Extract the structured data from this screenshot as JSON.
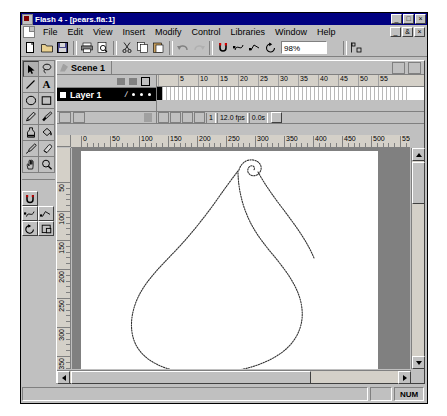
{
  "window": {
    "title": "Flash 4 - [pears.fla:1]",
    "app_icon": "flash-icon",
    "minimize": "_",
    "maximize": "□",
    "close": "×"
  },
  "menubar": {
    "doc_icon": "document-icon",
    "items": [
      {
        "label": "File",
        "accel": "F"
      },
      {
        "label": "Edit",
        "accel": "E"
      },
      {
        "label": "View",
        "accel": "V"
      },
      {
        "label": "Insert",
        "accel": "I"
      },
      {
        "label": "Modify",
        "accel": "o"
      },
      {
        "label": "Control",
        "accel": "C"
      },
      {
        "label": "Libraries",
        "accel": "L"
      },
      {
        "label": "Window",
        "accel": "W"
      },
      {
        "label": "Help",
        "accel": "H"
      }
    ],
    "mdi_minimize": "_",
    "mdi_restore": "&",
    "mdi_close": "×"
  },
  "toolbar": {
    "buttons": [
      "new-icon",
      "open-icon",
      "save-icon",
      "print-icon",
      "print-preview-icon",
      "cut-icon",
      "copy-icon",
      "paste-icon",
      "undo-icon",
      "redo-icon",
      "snap-icon",
      "smooth-icon",
      "straighten-icon",
      "rotate-icon"
    ],
    "zoom_value": "98%",
    "zoom_dropdown_icon": "chevron-down-icon",
    "align_icon": "align-icon"
  },
  "scenebar": {
    "scene_icon": "scene-icon",
    "scene_name": "Scene 1",
    "edit_scene_icon": "edit-scene-icon",
    "edit_symbol_icon": "edit-symbol-icon"
  },
  "timeline": {
    "layer_header_icons": [
      "eye-icon",
      "lock-icon",
      "outline-icon"
    ],
    "layers": [
      {
        "name": "Layer 1",
        "selected": true,
        "pencil_icon": "pencil-icon"
      }
    ],
    "add_layer_icon": "add-layer-icon",
    "add_guide_icon": "add-guide-icon",
    "delete_layer_icon": "trash-icon",
    "ruler_ticks": [
      "5",
      "10",
      "15",
      "20",
      "25",
      "30",
      "35",
      "40",
      "45",
      "50",
      "55"
    ],
    "current_frame": "1",
    "frame_rate": "12.0 fps",
    "elapsed_time": "0.0s",
    "onion_buttons": [
      "onion-skin-icon",
      "onion-outline-icon",
      "edit-multiple-icon",
      "modify-onion-icon"
    ],
    "center_frame_icon": "center-frame-icon"
  },
  "stage": {
    "hruler_ticks": [
      "0",
      "50",
      "100",
      "150",
      "200",
      "250",
      "300",
      "350",
      "400",
      "450",
      "500",
      "550",
      "600"
    ],
    "vruler_ticks": [
      "50",
      "100",
      "150",
      "200",
      "250",
      "300",
      "350"
    ],
    "artwork": "pear-outline-shape",
    "background_color": "#ffffff",
    "pasteboard_color": "#808080"
  },
  "toolbox": {
    "tools": [
      {
        "name": "arrow-tool",
        "icon": "arrow-icon",
        "selected": true
      },
      {
        "name": "lasso-tool",
        "icon": "lasso-icon",
        "selected": false
      },
      {
        "name": "line-tool",
        "icon": "line-icon",
        "selected": false
      },
      {
        "name": "text-tool",
        "icon": "text-a-icon",
        "selected": false
      },
      {
        "name": "oval-tool",
        "icon": "oval-icon",
        "selected": false
      },
      {
        "name": "rectangle-tool",
        "icon": "rectangle-icon",
        "selected": false
      },
      {
        "name": "pencil-tool",
        "icon": "pencil-icon",
        "selected": false
      },
      {
        "name": "brush-tool",
        "icon": "brush-icon",
        "selected": false
      },
      {
        "name": "ink-bottle-tool",
        "icon": "ink-bottle-icon",
        "selected": false
      },
      {
        "name": "paint-bucket-tool",
        "icon": "paint-bucket-icon",
        "selected": false
      },
      {
        "name": "dropper-tool",
        "icon": "eyedropper-icon",
        "selected": false
      },
      {
        "name": "eraser-tool",
        "icon": "eraser-icon",
        "selected": false
      },
      {
        "name": "hand-tool",
        "icon": "hand-icon",
        "selected": false
      },
      {
        "name": "magnifier-tool",
        "icon": "magnifier-icon",
        "selected": false
      }
    ],
    "options": [
      {
        "name": "snap-option",
        "icon": "magnet-icon"
      },
      {
        "name": "smooth-option",
        "icon": "smooth-icon"
      },
      {
        "name": "straighten-option",
        "icon": "straighten-icon"
      },
      {
        "name": "rotate-option",
        "icon": "rotate-icon"
      },
      {
        "name": "scale-option",
        "icon": "scale-icon"
      }
    ]
  },
  "statusbar": {
    "message": "",
    "num_indicator": "NUM"
  },
  "colors": {
    "titlebar": "#000080",
    "chrome": "#c0c0c0",
    "pasteboard": "#808080",
    "stage": "#ffffff",
    "layer_selected": "#000000"
  }
}
